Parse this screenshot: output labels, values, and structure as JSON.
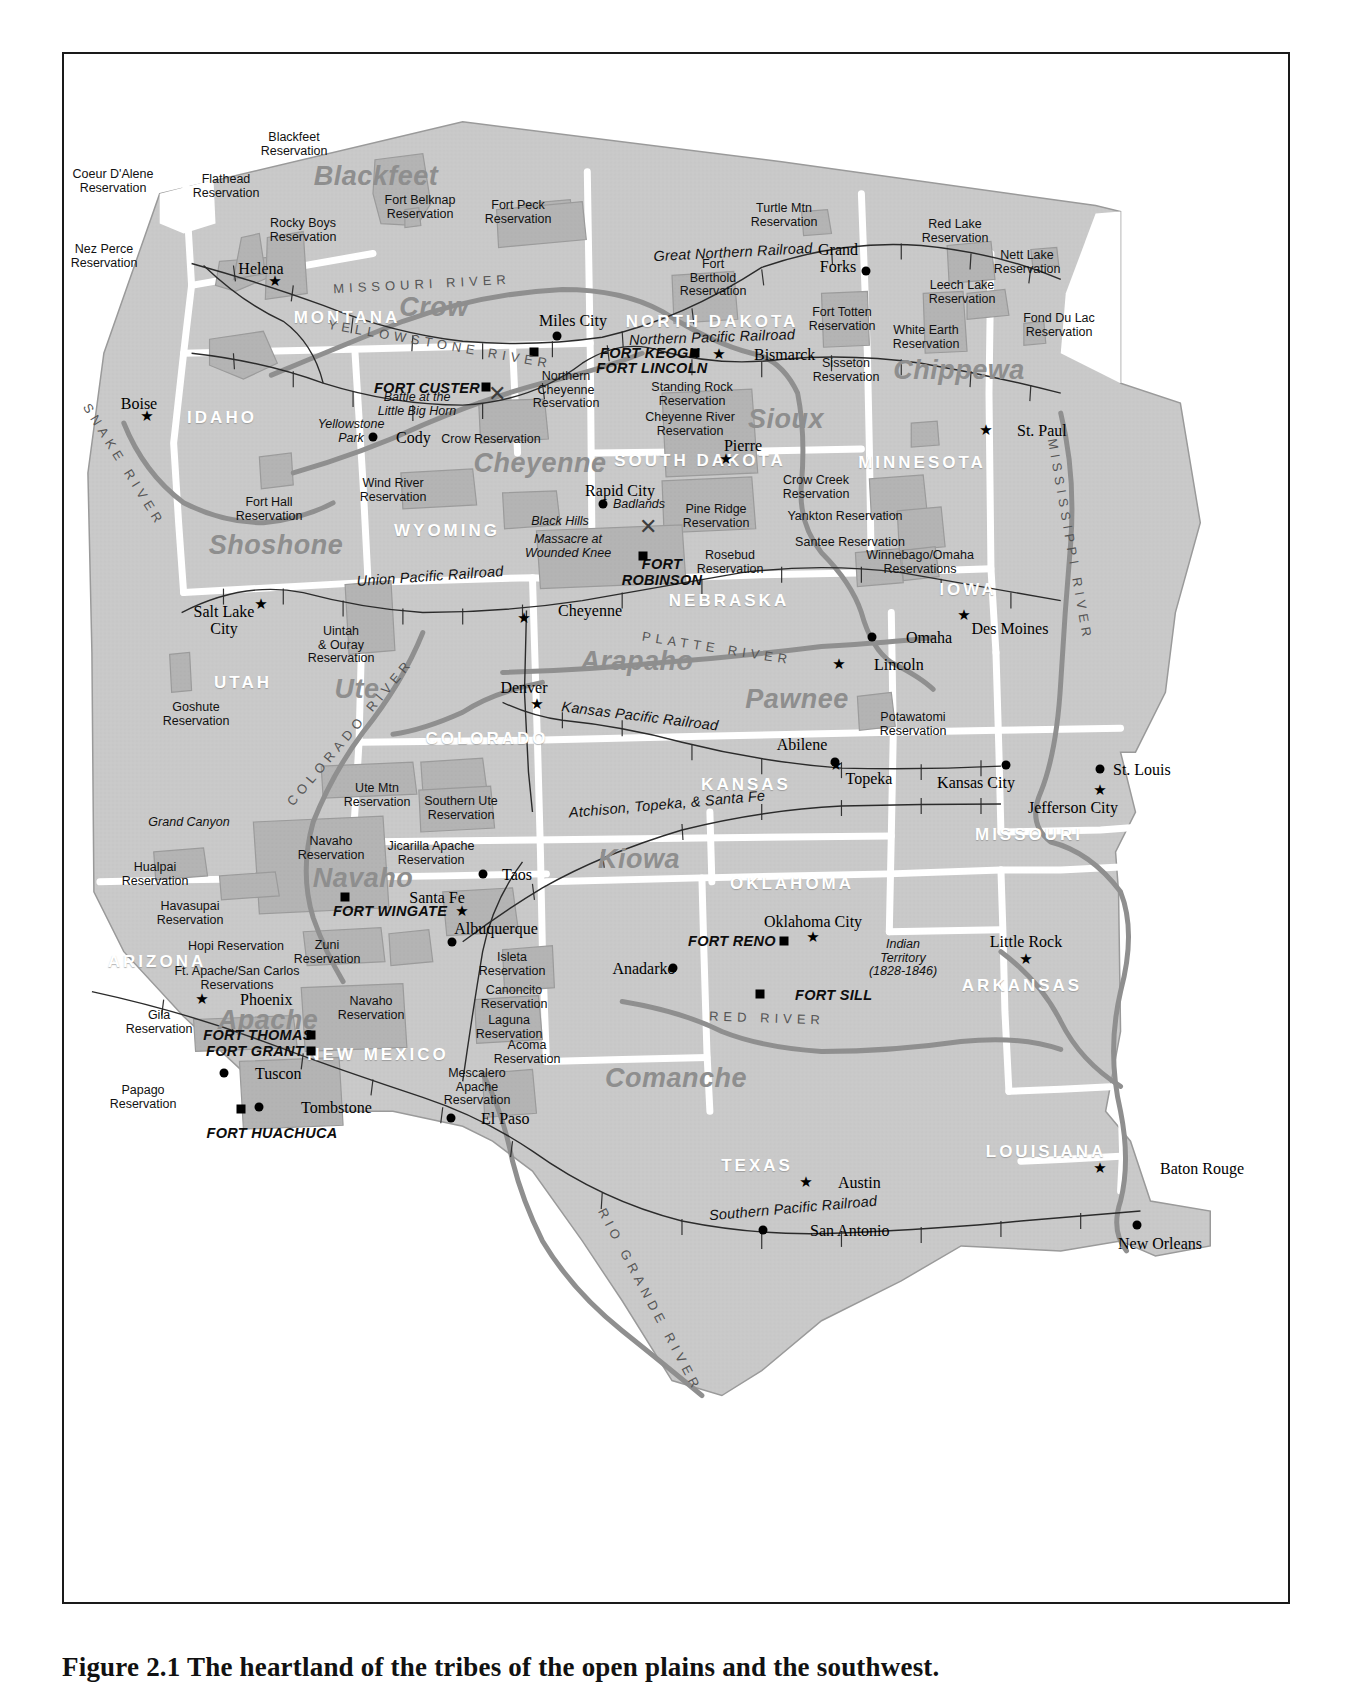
{
  "caption": "Figure 2.1  The heartland of the tribes of the open plains and the southwest.",
  "map": {
    "title_present": false,
    "colors": {
      "land_fill": "#c9c9c9",
      "reservation_fill": "#b3b3b3",
      "state_border": "#ffffff",
      "river": "#8f8f8f",
      "railroad": "#2b2b2b",
      "tribe_text": "#8e8e8e",
      "frame": "#1a1a1a"
    },
    "states": [
      {
        "name": "MONTANA",
        "x": 347,
        "y": 318
      },
      {
        "name": "IDAHO",
        "x": 222,
        "y": 418
      },
      {
        "name": "NORTH DAKOTA",
        "x": 712,
        "y": 322
      },
      {
        "name": "SOUTH DAKOTA",
        "x": 700,
        "y": 461
      },
      {
        "name": "MINNESOTA",
        "x": 922,
        "y": 463
      },
      {
        "name": "WYOMING",
        "x": 447,
        "y": 531
      },
      {
        "name": "NEBRASKA",
        "x": 729,
        "y": 601
      },
      {
        "name": "IOWA",
        "x": 968,
        "y": 590
      },
      {
        "name": "UTAH",
        "x": 243,
        "y": 683
      },
      {
        "name": "COLORADO",
        "x": 487,
        "y": 739
      },
      {
        "name": "KANSAS",
        "x": 746,
        "y": 785
      },
      {
        "name": "MISSOURI",
        "x": 1029,
        "y": 835
      },
      {
        "name": "OKLAHOMA",
        "x": 792,
        "y": 884
      },
      {
        "name": "ARKANSAS",
        "x": 1022,
        "y": 986
      },
      {
        "name": "ARIZONA",
        "x": 157,
        "y": 962
      },
      {
        "name": "NEW MEXICO",
        "x": 378,
        "y": 1055
      },
      {
        "name": "TEXAS",
        "x": 757,
        "y": 1166
      },
      {
        "name": "LOUISIANA",
        "x": 1046,
        "y": 1152
      }
    ],
    "tribes": [
      {
        "name": "Blackfeet",
        "x": 376,
        "y": 176,
        "size": "lg"
      },
      {
        "name": "Crow",
        "x": 434,
        "y": 307,
        "size": "lg"
      },
      {
        "name": "Chippewa",
        "x": 959,
        "y": 370,
        "size": "lg"
      },
      {
        "name": "Sioux",
        "x": 786,
        "y": 419,
        "size": "lg"
      },
      {
        "name": "Cheyenne",
        "x": 540,
        "y": 463,
        "size": "lg"
      },
      {
        "name": "Shoshone",
        "x": 276,
        "y": 545,
        "size": "lg"
      },
      {
        "name": "Arapaho",
        "x": 637,
        "y": 661,
        "size": "lg"
      },
      {
        "name": "Pawnee",
        "x": 797,
        "y": 699,
        "size": "lg"
      },
      {
        "name": "Ute",
        "x": 357,
        "y": 689,
        "size": "lg"
      },
      {
        "name": "Navaho",
        "x": 363,
        "y": 878,
        "size": "lg"
      },
      {
        "name": "Kiowa",
        "x": 639,
        "y": 859,
        "size": "lg"
      },
      {
        "name": "Apache",
        "x": 268,
        "y": 1020,
        "size": "lg"
      },
      {
        "name": "Comanche",
        "x": 676,
        "y": 1078,
        "size": "lg"
      }
    ],
    "cities": [
      {
        "name": "Helena",
        "x": 261,
        "y": 268,
        "marker": "star",
        "mx": 275,
        "my": 281,
        "align": "c"
      },
      {
        "name": "Boise",
        "x": 139,
        "y": 403,
        "marker": "star",
        "mx": 147,
        "my": 416,
        "align": "c"
      },
      {
        "name": "Miles City",
        "x": 573,
        "y": 320,
        "marker": "dot",
        "mx": 557,
        "my": 336,
        "align": "c"
      },
      {
        "name": "Bismarck",
        "x": 754,
        "y": 354,
        "marker": "star",
        "mx": 719,
        "my": 354,
        "align": "l"
      },
      {
        "name": "Grand\nForks",
        "x": 838,
        "y": 258,
        "marker": "dot",
        "mx": 866,
        "my": 271,
        "align": "c"
      },
      {
        "name": "St. Paul",
        "x": 1017,
        "y": 430,
        "marker": "star",
        "mx": 986,
        "my": 430,
        "align": "l"
      },
      {
        "name": "Pierre",
        "x": 743,
        "y": 445,
        "marker": "star",
        "mx": 726,
        "my": 459,
        "align": "c"
      },
      {
        "name": "Rapid City",
        "x": 620,
        "y": 490,
        "marker": "dot",
        "mx": 603,
        "my": 504,
        "align": "c"
      },
      {
        "name": "Cody",
        "x": 396,
        "y": 437,
        "marker": "dot",
        "mx": 373,
        "my": 437,
        "align": "l"
      },
      {
        "name": "Cheyenne",
        "x": 558,
        "y": 610,
        "marker": "star",
        "mx": 524,
        "my": 618,
        "align": "l"
      },
      {
        "name": "Salt Lake\nCity",
        "x": 224,
        "y": 620,
        "marker": "star",
        "mx": 261,
        "my": 604,
        "align": "c"
      },
      {
        "name": "Denver",
        "x": 524,
        "y": 687,
        "marker": "star",
        "mx": 537,
        "my": 704,
        "align": "c"
      },
      {
        "name": "Omaha",
        "x": 906,
        "y": 637,
        "marker": "dot",
        "mx": 872,
        "my": 637,
        "align": "l"
      },
      {
        "name": "Des Moines",
        "x": 1010,
        "y": 628,
        "marker": "star",
        "mx": 964,
        "my": 615,
        "align": "c"
      },
      {
        "name": "Lincoln",
        "x": 874,
        "y": 664,
        "marker": "star",
        "mx": 839,
        "my": 664,
        "align": "l"
      },
      {
        "name": "Abilene",
        "x": 802,
        "y": 744,
        "marker": "dot",
        "mx": 835,
        "my": 762,
        "align": "c"
      },
      {
        "name": "Topeka",
        "x": 869,
        "y": 778,
        "marker": "star",
        "mx": 836,
        "my": 765,
        "align": "c"
      },
      {
        "name": "Kansas City",
        "x": 976,
        "y": 782,
        "marker": "dot",
        "mx": 1006,
        "my": 765,
        "align": "c"
      },
      {
        "name": "St. Louis",
        "x": 1113,
        "y": 769,
        "marker": "dot",
        "mx": 1100,
        "my": 769,
        "align": "l"
      },
      {
        "name": "Jefferson City",
        "x": 1073,
        "y": 807,
        "marker": "star",
        "mx": 1100,
        "my": 790,
        "align": "c"
      },
      {
        "name": "Little Rock",
        "x": 1026,
        "y": 941,
        "marker": "star",
        "mx": 1026,
        "my": 959,
        "align": "c"
      },
      {
        "name": "Oklahoma City",
        "x": 813,
        "y": 921,
        "marker": "star",
        "mx": 813,
        "my": 937,
        "align": "c"
      },
      {
        "name": "Anadarko",
        "x": 644,
        "y": 968,
        "marker": "dot",
        "mx": 673,
        "my": 968,
        "align": "c"
      },
      {
        "name": "Taos",
        "x": 502,
        "y": 874,
        "marker": "dot",
        "mx": 483,
        "my": 874,
        "align": "l"
      },
      {
        "name": "Santa Fe",
        "x": 437,
        "y": 897,
        "marker": "star",
        "mx": 462,
        "my": 911,
        "align": "c"
      },
      {
        "name": "Albuquerque",
        "x": 496,
        "y": 928,
        "marker": "dot",
        "mx": 452,
        "my": 942,
        "align": "c"
      },
      {
        "name": "Phoenix",
        "x": 240,
        "y": 999,
        "marker": "star",
        "mx": 202,
        "my": 999,
        "align": "l"
      },
      {
        "name": "Tuscon",
        "x": 255,
        "y": 1073,
        "marker": "dot",
        "mx": 224,
        "my": 1073,
        "align": "l"
      },
      {
        "name": "Tombstone",
        "x": 301,
        "y": 1107,
        "marker": "dot",
        "mx": 259,
        "my": 1107,
        "align": "l"
      },
      {
        "name": "El Paso",
        "x": 481,
        "y": 1118,
        "marker": "dot",
        "mx": 451,
        "my": 1118,
        "align": "l"
      },
      {
        "name": "Austin",
        "x": 838,
        "y": 1182,
        "marker": "star",
        "mx": 806,
        "my": 1182,
        "align": "l"
      },
      {
        "name": "San Antonio",
        "x": 810,
        "y": 1230,
        "marker": "dot",
        "mx": 763,
        "my": 1230,
        "align": "l"
      },
      {
        "name": "Baton Rouge",
        "x": 1160,
        "y": 1168,
        "marker": "star",
        "mx": 1100,
        "my": 1168,
        "align": "l"
      },
      {
        "name": "New Orleans",
        "x": 1160,
        "y": 1243,
        "marker": "dot",
        "mx": 1137,
        "my": 1225,
        "align": "c"
      }
    ],
    "forts": [
      {
        "name": "FORT KEOGH",
        "x": 600,
        "y": 353,
        "marker": "sq",
        "mx": 534,
        "my": 352,
        "align": "l"
      },
      {
        "name": "FORT LINCOLN",
        "x": 652,
        "y": 368,
        "marker": "sq",
        "mx": 695,
        "my": 353,
        "align": "c"
      },
      {
        "name": "FORT CUSTER",
        "x": 427,
        "y": 388,
        "marker": "sq",
        "mx": 486,
        "my": 387,
        "align": "c"
      },
      {
        "name": "FORT\nROBINSON",
        "x": 662,
        "y": 572,
        "marker": "sq",
        "mx": 643,
        "my": 556,
        "align": "c"
      },
      {
        "name": "FORT WINGATE",
        "x": 390,
        "y": 911,
        "marker": "sq",
        "mx": 345,
        "my": 897,
        "align": "c"
      },
      {
        "name": "FORT RENO",
        "x": 732,
        "y": 941,
        "marker": "sq",
        "mx": 784,
        "my": 941,
        "align": "c"
      },
      {
        "name": "FORT SILL",
        "x": 795,
        "y": 995,
        "marker": "sq",
        "mx": 760,
        "my": 994,
        "align": "l"
      },
      {
        "name": "FORT THOMAS",
        "x": 258,
        "y": 1035,
        "marker": "sq",
        "mx": 311,
        "my": 1035,
        "align": "c"
      },
      {
        "name": "FORT GRANT",
        "x": 255,
        "y": 1051,
        "marker": "sq",
        "mx": 311,
        "my": 1051,
        "align": "c"
      },
      {
        "name": "FORT HUACHUCA",
        "x": 272,
        "y": 1133,
        "marker": "sq",
        "mx": 241,
        "my": 1109,
        "align": "c"
      }
    ],
    "reservations": [
      {
        "name": "Coeur D'Alene\nReservation",
        "x": 113,
        "y": 181
      },
      {
        "name": "Flathead\nReservation",
        "x": 226,
        "y": 186
      },
      {
        "name": "Blackfeet\nReservation",
        "x": 294,
        "y": 144
      },
      {
        "name": "Nez Perce\nReservation",
        "x": 104,
        "y": 256
      },
      {
        "name": "Rocky Boys\nReservation",
        "x": 303,
        "y": 230
      },
      {
        "name": "Fort Belknap\nReservation",
        "x": 420,
        "y": 207
      },
      {
        "name": "Fort Peck\nReservation",
        "x": 518,
        "y": 212
      },
      {
        "name": "Turtle Mtn\nReservation",
        "x": 784,
        "y": 215
      },
      {
        "name": "Red Lake\nReservation",
        "x": 955,
        "y": 231
      },
      {
        "name": "Nett Lake\nReservation",
        "x": 1027,
        "y": 262
      },
      {
        "name": "Leech Lake\nReservation",
        "x": 962,
        "y": 292
      },
      {
        "name": "Fond Du Lac\nReservation",
        "x": 1059,
        "y": 325
      },
      {
        "name": "Fort\nBerthold\nReservation",
        "x": 713,
        "y": 278
      },
      {
        "name": "Fort Totten\nReservation",
        "x": 842,
        "y": 319
      },
      {
        "name": "White Earth\nReservation",
        "x": 926,
        "y": 337
      },
      {
        "name": "Sisseton\nReservation",
        "x": 846,
        "y": 370
      },
      {
        "name": "Northern\nCheyenne\nReservation",
        "x": 566,
        "y": 390
      },
      {
        "name": "Standing Rock\nReservation",
        "x": 692,
        "y": 394
      },
      {
        "name": "Cheyenne River\nReservation",
        "x": 690,
        "y": 424
      },
      {
        "name": "Crow Reservation",
        "x": 491,
        "y": 440
      },
      {
        "name": "Crow Creek\nReservation",
        "x": 816,
        "y": 487
      },
      {
        "name": "Pine Ridge\nReservation",
        "x": 716,
        "y": 516
      },
      {
        "name": "Yankton Reservation",
        "x": 845,
        "y": 517
      },
      {
        "name": "Santee Reservation",
        "x": 850,
        "y": 543
      },
      {
        "name": "Rosebud\nReservation",
        "x": 730,
        "y": 562
      },
      {
        "name": "Winnebago/Omaha\nReservations",
        "x": 920,
        "y": 562
      },
      {
        "name": "Wind River\nReservation",
        "x": 393,
        "y": 490
      },
      {
        "name": "Fort Hall\nReservation",
        "x": 269,
        "y": 509
      },
      {
        "name": "Uintah\n& Ouray\nReservation",
        "x": 341,
        "y": 645
      },
      {
        "name": "Goshute\nReservation",
        "x": 196,
        "y": 714
      },
      {
        "name": "Potawatomi\nReservation",
        "x": 913,
        "y": 724
      },
      {
        "name": "Ute Mtn\nReservation",
        "x": 377,
        "y": 795
      },
      {
        "name": "Southern Ute\nReservation",
        "x": 461,
        "y": 808
      },
      {
        "name": "Navaho\nReservation",
        "x": 331,
        "y": 848
      },
      {
        "name": "Jicarilla Apache\nReservation",
        "x": 431,
        "y": 853
      },
      {
        "name": "Hualpai\nReservation",
        "x": 155,
        "y": 874
      },
      {
        "name": "Havasupai\nReservation",
        "x": 190,
        "y": 913
      },
      {
        "name": "Hopi Reservation",
        "x": 236,
        "y": 947
      },
      {
        "name": "Zuni\nReservation",
        "x": 327,
        "y": 952
      },
      {
        "name": "Isleta\nReservation",
        "x": 512,
        "y": 964
      },
      {
        "name": "Ft. Apache/San Carlos\nReservations",
        "x": 237,
        "y": 978
      },
      {
        "name": "Canoncito\nReservation",
        "x": 514,
        "y": 997
      },
      {
        "name": "Navaho\nReservation",
        "x": 371,
        "y": 1008
      },
      {
        "name": "Laguna\nReservation",
        "x": 509,
        "y": 1027
      },
      {
        "name": "Gila\nReservation",
        "x": 159,
        "y": 1022
      },
      {
        "name": "Acoma\nReservation",
        "x": 527,
        "y": 1052
      },
      {
        "name": "Mescalero\nApache\nReservation",
        "x": 477,
        "y": 1087
      },
      {
        "name": "Papago\nReservation",
        "x": 143,
        "y": 1097
      }
    ],
    "rivers": [
      {
        "name": "MISSOURI RIVER",
        "x": 422,
        "y": 284,
        "rot": -3
      },
      {
        "name": "YELLOWSTONE RIVER",
        "x": 440,
        "y": 344,
        "rot": 10
      },
      {
        "name": "SNAKE RIVER",
        "x": 124,
        "y": 465,
        "rot": 58
      },
      {
        "name": "COLORADO RIVER",
        "x": 350,
        "y": 732,
        "rot": -50
      },
      {
        "name": "PLATTE RIVER",
        "x": 717,
        "y": 648,
        "rot": 9
      },
      {
        "name": "MISSISSIPPI RIVER",
        "x": 1070,
        "y": 540,
        "rot": 80
      },
      {
        "name": "RED RIVER",
        "x": 767,
        "y": 1018,
        "rot": 2
      },
      {
        "name": "RIO GRANDE RIVER",
        "x": 650,
        "y": 1300,
        "rot": 62
      }
    ],
    "railroads": [
      {
        "name": "Great   Northern   Railroad",
        "x": 733,
        "y": 252,
        "rot": -3
      },
      {
        "name": "Northern  Pacific   Railroad",
        "x": 712,
        "y": 337,
        "rot": -2
      },
      {
        "name": "Union  Pacific   Railroad",
        "x": 430,
        "y": 576,
        "rot": -4
      },
      {
        "name": "Kansas   Pacific   Railroad",
        "x": 640,
        "y": 716,
        "rot": 7
      },
      {
        "name": "Atchison,  Topeka,  & Santa Fe",
        "x": 667,
        "y": 804,
        "rot": -5
      },
      {
        "name": "Southern   Pacific   Railroad",
        "x": 793,
        "y": 1208,
        "rot": -5
      }
    ],
    "annotations": [
      {
        "name": "Battle at the\nLittle Big Horn",
        "x": 417,
        "y": 404
      },
      {
        "name": "Yellowstone\nPark",
        "x": 351,
        "y": 431
      },
      {
        "name": "Badlands",
        "x": 639,
        "y": 505
      },
      {
        "name": "Black Hills",
        "x": 560,
        "y": 522
      },
      {
        "name": "Massacre at\nWounded Knee",
        "x": 568,
        "y": 546
      },
      {
        "name": "Grand Canyon",
        "x": 189,
        "y": 823
      },
      {
        "name": "Indian\nTerritory\n(1828-1846)",
        "x": 903,
        "y": 958
      }
    ]
  }
}
